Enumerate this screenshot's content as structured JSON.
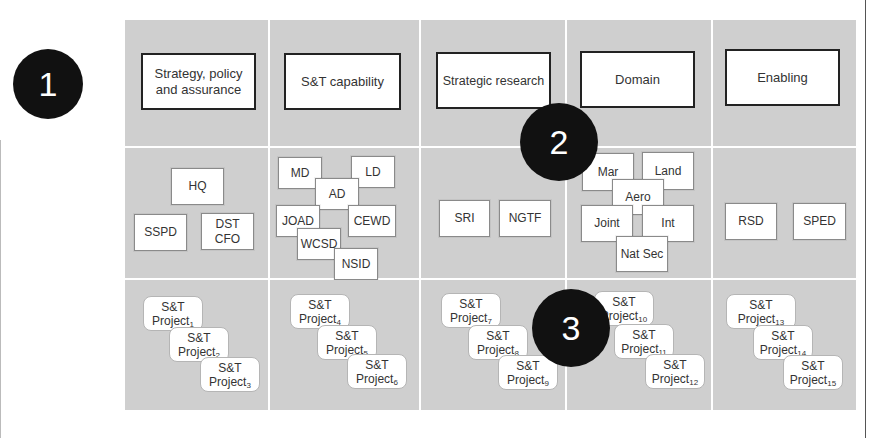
{
  "badges": [
    {
      "label": "1"
    },
    {
      "label": "2"
    },
    {
      "label": "3"
    }
  ],
  "columns": [
    {
      "header": "Strategy, policy and assurance",
      "units": [
        "HQ",
        "SSPD",
        "DST CFO"
      ],
      "projects": [
        {
          "name": "S&T",
          "sub": "Project",
          "n": "1"
        },
        {
          "name": "S&T",
          "sub": "Project",
          "n": "2"
        },
        {
          "name": "S&T",
          "sub": "Project",
          "n": "3"
        }
      ]
    },
    {
      "header": "S&T capability",
      "units": [
        "MD",
        "LD",
        "AD",
        "JOAD",
        "CEWD",
        "WCSD",
        "NSID"
      ],
      "projects": [
        {
          "name": "S&T",
          "sub": "Project",
          "n": "4"
        },
        {
          "name": "S&T",
          "sub": "Project",
          "n": "5"
        },
        {
          "name": "S&T",
          "sub": "Project",
          "n": "6"
        }
      ]
    },
    {
      "header": "Strategic research",
      "units": [
        "SRI",
        "NGTF"
      ],
      "projects": [
        {
          "name": "S&T",
          "sub": "Project",
          "n": "7"
        },
        {
          "name": "S&T",
          "sub": "Project",
          "n": "8"
        },
        {
          "name": "S&T",
          "sub": "Project",
          "n": "9"
        }
      ]
    },
    {
      "header": "Domain",
      "units": [
        "Mar",
        "Land",
        "Aero",
        "Joint",
        "Int",
        "Nat Sec"
      ],
      "projects": [
        {
          "name": "S&T",
          "sub": "Project",
          "n": "10"
        },
        {
          "name": "S&T",
          "sub": "Project",
          "n": "11"
        },
        {
          "name": "S&T",
          "sub": "Project",
          "n": "12"
        }
      ]
    },
    {
      "header": "Enabling",
      "units": [
        "RSD",
        "SPED"
      ],
      "projects": [
        {
          "name": "S&T",
          "sub": "Project",
          "n": "13"
        },
        {
          "name": "S&T",
          "sub": "Project",
          "n": "14"
        },
        {
          "name": "S&T",
          "sub": "Project",
          "n": "15"
        }
      ]
    }
  ]
}
